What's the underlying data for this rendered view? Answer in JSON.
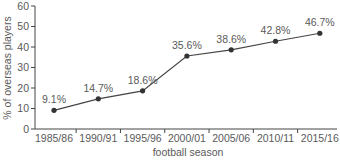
{
  "chart_data": {
    "type": "line",
    "title": "",
    "xlabel": "football season",
    "ylabel": "% of overseas players",
    "categories": [
      "1985/86",
      "1990/91",
      "1995/96",
      "2000/01",
      "2005/06",
      "2010/11",
      "2015/16"
    ],
    "values": [
      9.1,
      14.7,
      18.6,
      35.6,
      38.6,
      42.8,
      46.7
    ],
    "data_labels": [
      "9.1%",
      "14.7%",
      "18.6%",
      "35.6%",
      "38.6%",
      "42.8%",
      "46.7%"
    ],
    "ylim": [
      0,
      60
    ],
    "yticks": [
      0,
      10,
      20,
      30,
      40,
      50,
      60
    ],
    "grid": false,
    "legend": null,
    "colors": {
      "line": "#444444",
      "marker": "#333333",
      "axis": "#444444",
      "text": "#5a5a5a"
    }
  }
}
